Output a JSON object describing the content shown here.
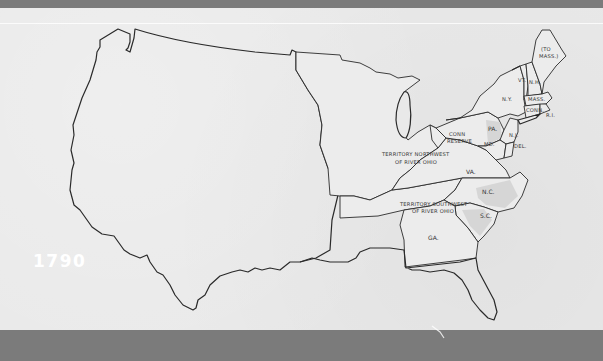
{
  "map": {
    "year": "1790",
    "regions": [
      {
        "id": "maine",
        "label_line1": "(TO",
        "label_line2": "MASS.)"
      },
      {
        "id": "vt",
        "label": "VT."
      },
      {
        "id": "nh",
        "label": "N.H."
      },
      {
        "id": "mass",
        "label": "MASS."
      },
      {
        "id": "conn",
        "label": "CONN."
      },
      {
        "id": "ri",
        "label": "R.I."
      },
      {
        "id": "ny",
        "label": "N.Y."
      },
      {
        "id": "pa",
        "label": "PA."
      },
      {
        "id": "nj",
        "label": "N.J."
      },
      {
        "id": "md",
        "label": "MD."
      },
      {
        "id": "del",
        "label": "DEL."
      },
      {
        "id": "va",
        "label": "VA."
      },
      {
        "id": "nc",
        "label": "N.C."
      },
      {
        "id": "sc",
        "label": "S.C."
      },
      {
        "id": "ga",
        "label": "GA."
      },
      {
        "id": "conn-reserve",
        "label_line1": "CONN",
        "label_line2": "RESERVE"
      },
      {
        "id": "territory-nw",
        "label_line1": "TERRITORY NORTHWEST",
        "label_line2": "OF RIVER OHIO"
      },
      {
        "id": "territory-sw",
        "label_line1": "TERRITORY SOUTHWEST",
        "label_line2": "OF RIVER OHIO"
      }
    ],
    "colors": {
      "paper": "#e9e9e9",
      "band": "#7b7b7b",
      "outline": "#2a2a2a",
      "shaded_states": "#d6d6d6",
      "year_text": "#ffffff"
    }
  }
}
